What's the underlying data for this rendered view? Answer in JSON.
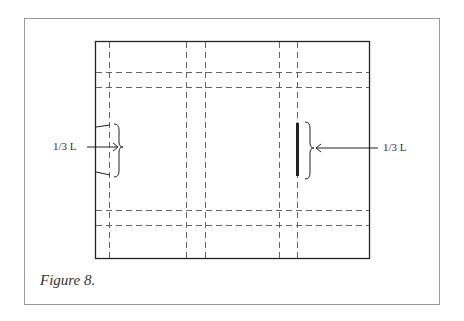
{
  "figure": {
    "caption": "Figure 8.",
    "left_label": "1/3 L",
    "right_label": "1/3 L"
  },
  "colors": {
    "frame": "#9a9a9a",
    "line": "#222222",
    "dash": "#555555"
  }
}
